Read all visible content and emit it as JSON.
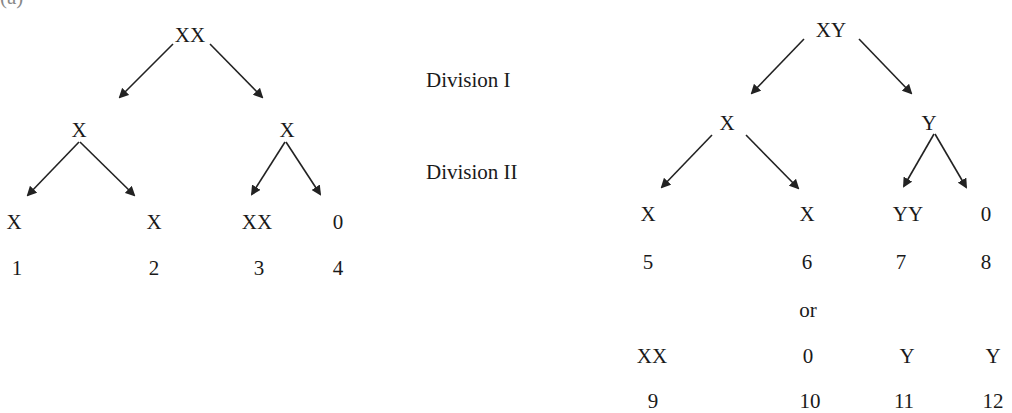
{
  "figure_label": "(a)",
  "division_labels": {
    "division1": "Division I",
    "division2": "Division II"
  },
  "tree_xx": {
    "root": "XX",
    "division1": [
      "X",
      "X"
    ],
    "division2": [
      "X",
      "X",
      "XX",
      "0"
    ],
    "numbers": [
      "1",
      "2",
      "3",
      "4"
    ]
  },
  "tree_xy": {
    "root": "XY",
    "division1": [
      "X",
      "Y"
    ],
    "division2": [
      "X",
      "X",
      "YY",
      "0"
    ],
    "numbers_a": [
      "5",
      "6",
      "7",
      "8"
    ],
    "or_label": "or",
    "division2_alt": [
      "XX",
      "0",
      "Y",
      "Y"
    ],
    "numbers_b": [
      "9",
      "10",
      "11",
      "12"
    ]
  },
  "colors": {
    "arrow": "#222222",
    "text": "#1a1a1a"
  }
}
